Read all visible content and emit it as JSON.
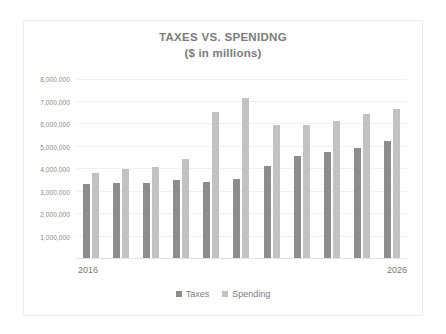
{
  "chart_data": {
    "type": "bar",
    "title": "TAXES VS. SPENIDNG",
    "subtitle": "($ in millions)",
    "xlabel": "",
    "ylabel": "",
    "categories": [
      "2016",
      "2017",
      "2018",
      "2019",
      "2020",
      "2021",
      "2022",
      "2023",
      "2024",
      "2025",
      "2026"
    ],
    "visible_tick_labels": [
      "2016",
      "2026"
    ],
    "series": [
      {
        "name": "Taxes",
        "color": "#8d8d8d",
        "values": [
          3350000,
          3400000,
          3380000,
          3500000,
          3440000,
          3570000,
          4140000,
          4600000,
          4760000,
          4960000,
          5280000
        ]
      },
      {
        "name": "Spending",
        "color": "#c2c2c2",
        "values": [
          3850000,
          3990000,
          4100000,
          4440000,
          6560000,
          7180000,
          5970000,
          5960000,
          6160000,
          6480000,
          6690000
        ]
      }
    ],
    "ylim": [
      0,
      8200000
    ],
    "yticks": [
      1000000,
      2000000,
      3000000,
      4000000,
      5000000,
      6000000,
      7000000,
      8000000
    ],
    "ytick_labels": [
      "1,000,000",
      "2,000,000",
      "3,000,000",
      "4,000,000",
      "5,000,000",
      "6,000,000",
      "7,000,000",
      "8,000,000"
    ],
    "grid": true,
    "legend_position": "bottom",
    "legend": [
      "Taxes",
      "Spending"
    ],
    "background": "#ffffff",
    "border_color": "#ebebeb",
    "gridline_color": "#f0f0f0",
    "text_color": "#7b7b7b"
  }
}
